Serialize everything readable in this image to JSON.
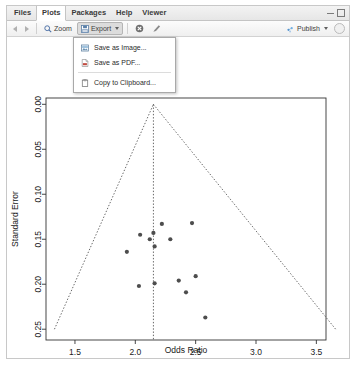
{
  "window": {
    "tabs": [
      {
        "id": "files",
        "label": "Files",
        "active": false
      },
      {
        "id": "plots",
        "label": "Plots",
        "active": true
      },
      {
        "id": "packages",
        "label": "Packages",
        "active": false
      },
      {
        "id": "help",
        "label": "Help",
        "active": false
      },
      {
        "id": "viewer",
        "label": "Viewer",
        "active": false
      }
    ],
    "minimize_icon": "minimize-icon",
    "maximize_icon": "maximize-icon"
  },
  "toolbar": {
    "back_icon": "back-arrow-icon",
    "forward_icon": "forward-arrow-icon",
    "zoom_label": "Zoom",
    "zoom_icon": "magnifier-icon",
    "export_label": "Export",
    "export_icon": "export-disk-icon",
    "export_caret_icon": "chevron-down-icon",
    "remove_icon": "remove-plot-icon",
    "clear_icon": "clear-all-plots-icon",
    "publish_label": "Publish",
    "publish_icon": "publish-icon",
    "publish_caret_icon": "chevron-down-icon",
    "refresh_icon": "refresh-icon"
  },
  "export_menu": {
    "visible": true,
    "items": [
      {
        "id": "save-image",
        "label": "Save as Image...",
        "icon": "image-file-icon"
      },
      {
        "id": "save-pdf",
        "label": "Save as PDF...",
        "icon": "pdf-file-icon"
      },
      {
        "id": "copy-clipboard",
        "label": "Copy to Clipboard...",
        "icon": "clipboard-icon"
      }
    ]
  },
  "chart_data": {
    "type": "scatter",
    "title": "",
    "xlabel": "Odds Ratio",
    "ylabel": "Standard Error",
    "xlim": [
      1.26,
      3.58
    ],
    "ylim": [
      0.262,
      -0.007
    ],
    "y_inverted": true,
    "grid": false,
    "legend": null,
    "xticks": [
      1.5,
      2.0,
      2.5,
      3.0,
      3.5
    ],
    "xticklabels": [
      "1.5",
      "2.0",
      "2.5",
      "3.0",
      "3.5"
    ],
    "yticks": [
      0.0,
      0.05,
      0.1,
      0.15,
      0.2,
      0.25
    ],
    "yticklabels": [
      "0.00",
      "0.05",
      "0.10",
      "0.15",
      "0.20",
      "0.25"
    ],
    "reference_line": {
      "type": "vertical-dashed",
      "x": 2.15
    },
    "funnel": {
      "apex": {
        "x": 2.15,
        "y": 0.0
      },
      "left_base": {
        "x": 1.33,
        "y": 0.25
      },
      "right_base": {
        "x": 3.66,
        "y": 0.25
      },
      "style": "dotted"
    },
    "points": [
      {
        "x": 2.22,
        "y": 0.133
      },
      {
        "x": 2.47,
        "y": 0.132
      },
      {
        "x": 2.04,
        "y": 0.145
      },
      {
        "x": 2.12,
        "y": 0.15
      },
      {
        "x": 2.29,
        "y": 0.15
      },
      {
        "x": 2.15,
        "y": 0.143
      },
      {
        "x": 2.16,
        "y": 0.158
      },
      {
        "x": 1.93,
        "y": 0.164
      },
      {
        "x": 2.5,
        "y": 0.191
      },
      {
        "x": 2.36,
        "y": 0.196
      },
      {
        "x": 2.03,
        "y": 0.202
      },
      {
        "x": 2.16,
        "y": 0.199
      },
      {
        "x": 2.42,
        "y": 0.209
      },
      {
        "x": 2.58,
        "y": 0.237
      }
    ],
    "point_color": "#4d4d4d",
    "axis_color": "#333333"
  }
}
